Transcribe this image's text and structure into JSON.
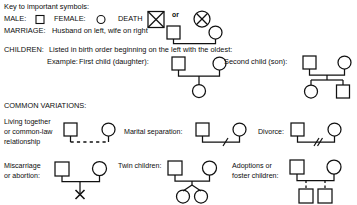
{
  "title": "Key to important symbols:",
  "legend": {
    "male_label": "MALE:",
    "male_icon": "square-symbol",
    "female_label": "FEMALE:",
    "female_icon": "circle-symbol",
    "death_label": "DEATH",
    "death_icon_1": "crossed-square-symbol",
    "or_label": "or",
    "death_icon_2": "crossed-circle-symbol"
  },
  "marriage": {
    "label": "MARRIAGE:",
    "description": "Husband on left, wife on right",
    "husband_icon": "square-symbol",
    "wife_icon": "circle-symbol",
    "link_icon": "marriage-line"
  },
  "children": {
    "label": "CHILDREN:",
    "description": "Listed in birth order beginning on the left with the oldest:",
    "example_label": "Example:",
    "first_child_label": "First child (daughter):",
    "first_child_icon": "circle-symbol",
    "second_child_label": "Second child (son):",
    "second_child_icons": [
      "circle-symbol",
      "square-symbol"
    ]
  },
  "variations": {
    "heading": "COMMON VARIATIONS:",
    "items": [
      {
        "label_lines": [
          "Living together",
          "or common-law",
          "relationship"
        ],
        "icon": "dashed-union-line"
      },
      {
        "label_lines": [
          "Marital separation:"
        ],
        "icon": "single-slash-union-line"
      },
      {
        "label_lines": [
          "Divorce:"
        ],
        "icon": "double-slash-union-line"
      },
      {
        "label_lines": [
          "Miscarriage",
          "or abortion:"
        ],
        "icon": "x-terminated-descent-line"
      },
      {
        "label_lines": [
          "Twin children:"
        ],
        "icon": "twin-sibship-line"
      },
      {
        "label_lines": [
          "Adoptions or",
          "foster children:"
        ],
        "icon": "dashed-descent-line"
      }
    ]
  },
  "colors": {
    "ink": "#111111",
    "background": "#ffffff"
  }
}
